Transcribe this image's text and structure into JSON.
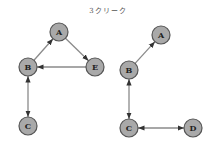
{
  "title": "3クリーク",
  "colors": {
    "node_fill": "#a9a9a9",
    "node_stroke": "#555555",
    "edge": "#8a8a8a",
    "arrow": "#333333"
  },
  "graphs": [
    {
      "name": "left",
      "nodes": [
        {
          "id": "A",
          "label": "A",
          "x": 59,
          "y": 32
        },
        {
          "id": "B",
          "label": "B",
          "x": 28,
          "y": 67
        },
        {
          "id": "E",
          "label": "E",
          "x": 95,
          "y": 67
        },
        {
          "id": "C",
          "label": "C",
          "x": 28,
          "y": 126
        }
      ],
      "edges": [
        {
          "from": "B",
          "to": "A",
          "directed": "forward"
        },
        {
          "from": "A",
          "to": "E",
          "directed": "forward"
        },
        {
          "from": "E",
          "to": "B",
          "directed": "forward"
        },
        {
          "from": "B",
          "to": "C",
          "directed": "both"
        }
      ]
    },
    {
      "name": "right",
      "nodes": [
        {
          "id": "A",
          "label": "A",
          "x": 161,
          "y": 35
        },
        {
          "id": "B",
          "label": "B",
          "x": 129,
          "y": 70
        },
        {
          "id": "C",
          "label": "C",
          "x": 129,
          "y": 128
        },
        {
          "id": "D",
          "label": "D",
          "x": 193,
          "y": 128
        }
      ],
      "edges": [
        {
          "from": "B",
          "to": "A",
          "directed": "forward"
        },
        {
          "from": "B",
          "to": "C",
          "directed": "both"
        },
        {
          "from": "C",
          "to": "D",
          "directed": "both"
        }
      ]
    }
  ]
}
